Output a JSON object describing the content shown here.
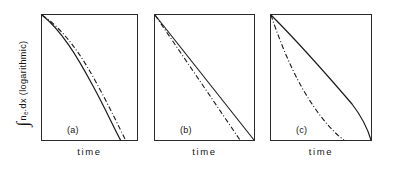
{
  "figure": {
    "ylabel_integral": "∫",
    "ylabel_main": "n",
    "ylabel_subscript": "e",
    "ylabel_rest": ".dx  (logarithmic)",
    "ylabel_full": "∫ n_e.dx (logarithmic)"
  },
  "panels": [
    {
      "id": "a",
      "letter": "(a)",
      "xlabel": "time",
      "solid_path": "M 1,1 C 20,16 36,42 52,72 C 63,92 72,112 80,127",
      "dashdot_path": "M 1,1 C 22,15 40,40 56,70 C 67,90 77,111 85,127"
    },
    {
      "id": "b",
      "letter": "(b)",
      "xlabel": "time",
      "solid_path": "M 1,1 L 100,126",
      "dashdot_path": "M 1,1 L 86,126"
    },
    {
      "id": "c",
      "letter": "(c)",
      "xlabel": "time",
      "solid_path": "M 1,1 C 26,26 58,62 82,90 C 92,103 98,116 101,126",
      "dashdot_path": "M 1,1 C 8,22 18,48 30,70 C 44,96 62,118 74,126"
    }
  ],
  "chart_data": {
    "type": "line",
    "title": "",
    "xlabel": "time",
    "ylabel": "∫ n_e.dx (logarithmic)",
    "ylabel_note": "logarithmic scale",
    "grid": false,
    "legend": "none",
    "axis_ticks": "none",
    "subplots": [
      {
        "label": "(a)",
        "description": "Both curves nearly coincident; convex decay that steepens with time (faster-than-exponential fall on a log axis).",
        "x": [
          0,
          0.1,
          0.2,
          0.3,
          0.4,
          0.5,
          0.6,
          0.7,
          0.8,
          0.9,
          1.0
        ],
        "series": [
          {
            "name": "solid",
            "style": "solid",
            "values": [
              1.0,
              0.97,
              0.93,
              0.87,
              0.79,
              0.69,
              0.57,
              0.44,
              0.3,
              0.15,
              0.0
            ]
          },
          {
            "name": "dash-dot",
            "style": "dash-dot",
            "values": [
              1.0,
              0.975,
              0.945,
              0.9,
              0.83,
              0.74,
              0.63,
              0.5,
              0.355,
              0.195,
              0.03
            ]
          }
        ]
      },
      {
        "label": "(b)",
        "description": "Both curves straight lines on the log axis (pure exponential decay); dash-dot has steeper slope than solid.",
        "x": [
          0,
          0.1,
          0.2,
          0.3,
          0.4,
          0.5,
          0.6,
          0.7,
          0.8,
          0.9,
          1.0
        ],
        "series": [
          {
            "name": "solid",
            "style": "solid",
            "values": [
              1.0,
              0.9,
              0.8,
              0.7,
              0.6,
              0.5,
              0.4,
              0.3,
              0.2,
              0.1,
              0.0
            ]
          },
          {
            "name": "dash-dot",
            "style": "dash-dot",
            "values": [
              1.0,
              0.883,
              0.767,
              0.65,
              0.533,
              0.417,
              0.3,
              0.183,
              0.067,
              null,
              null
            ]
          }
        ]
      },
      {
        "label": "(c)",
        "description": "Solid curve decays slowly at first then steepens; dash-dot falls steeply at once then flattens, lying well below the solid curve.",
        "x": [
          0,
          0.1,
          0.2,
          0.3,
          0.4,
          0.5,
          0.6,
          0.7,
          0.8,
          0.9,
          1.0
        ],
        "series": [
          {
            "name": "solid",
            "style": "solid",
            "values": [
              1.0,
              0.9,
              0.8,
              0.7,
              0.605,
              0.51,
              0.415,
              0.32,
              0.22,
              0.115,
              0.0
            ]
          },
          {
            "name": "dash-dot",
            "style": "dash-dot",
            "values": [
              1.0,
              0.79,
              0.64,
              0.525,
              0.43,
              0.345,
              0.27,
              0.195,
              0.12,
              0.045,
              null
            ]
          }
        ]
      }
    ]
  }
}
